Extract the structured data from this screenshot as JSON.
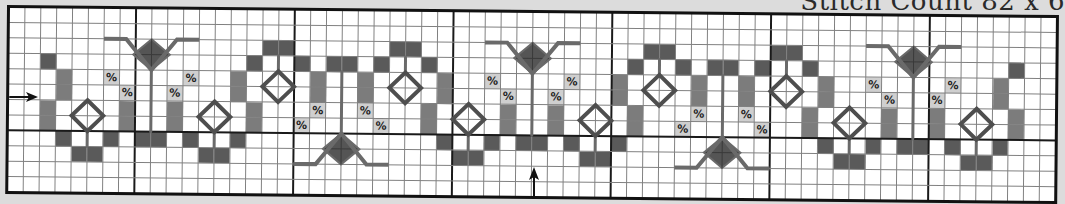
{
  "title": "Stitch Count 82 x 6",
  "chart": {
    "cols": 66,
    "rows": 12,
    "cell_w": 15.88,
    "cell_h": 15.42,
    "major_cols": [
      8,
      18,
      28,
      38,
      48,
      58
    ],
    "major_rows": [
      8
    ],
    "colors": {
      "background": "#ffffff",
      "grid": "#808080",
      "major": "#1a1a1a",
      "dark": "#5a5a5a",
      "medium": "#7c7c7c",
      "symbol_bg": "#cfcfcf",
      "backstitch": "#6a6a6a",
      "diamond_outline": "#4e4e4e",
      "flower_fill": "#555555"
    },
    "symbol_glyph": "%",
    "dark_cells": [
      [
        2,
        3
      ],
      [
        3,
        8
      ],
      [
        4,
        9
      ],
      [
        5,
        9
      ],
      [
        6,
        8
      ],
      [
        8,
        8
      ],
      [
        9,
        8
      ],
      [
        11,
        8
      ],
      [
        12,
        9
      ],
      [
        13,
        9
      ],
      [
        14,
        8
      ],
      [
        15,
        3
      ],
      [
        16,
        2
      ],
      [
        17,
        2
      ],
      [
        18,
        3
      ],
      [
        20,
        3
      ],
      [
        21,
        3
      ],
      [
        23,
        3
      ],
      [
        24,
        2
      ],
      [
        25,
        2
      ],
      [
        26,
        3
      ],
      [
        27,
        8
      ],
      [
        28,
        9
      ],
      [
        29,
        9
      ],
      [
        30,
        8
      ],
      [
        32,
        8
      ],
      [
        33,
        8
      ],
      [
        35,
        8
      ],
      [
        36,
        9
      ],
      [
        37,
        9
      ],
      [
        38,
        8
      ],
      [
        39,
        3
      ],
      [
        40,
        2
      ],
      [
        41,
        2
      ],
      [
        42,
        3
      ],
      [
        44,
        3
      ],
      [
        45,
        3
      ],
      [
        47,
        3
      ],
      [
        48,
        2
      ],
      [
        49,
        2
      ],
      [
        50,
        3
      ],
      [
        51,
        8
      ],
      [
        52,
        9
      ],
      [
        53,
        9
      ],
      [
        54,
        8
      ],
      [
        56,
        8
      ],
      [
        57,
        8
      ],
      [
        59,
        8
      ],
      [
        60,
        9
      ],
      [
        61,
        9
      ],
      [
        62,
        8
      ],
      [
        63,
        3
      ]
    ],
    "medium_cells": [
      [
        3,
        4
      ],
      [
        3,
        5
      ],
      [
        2,
        6
      ],
      [
        2,
        7
      ],
      [
        7,
        6
      ],
      [
        7,
        7
      ],
      [
        10,
        6
      ],
      [
        10,
        7
      ],
      [
        14,
        4
      ],
      [
        14,
        5
      ],
      [
        15,
        6
      ],
      [
        15,
        7
      ],
      [
        19,
        4
      ],
      [
        19,
        5
      ],
      [
        22,
        4
      ],
      [
        22,
        5
      ],
      [
        27,
        4
      ],
      [
        27,
        5
      ],
      [
        26,
        6
      ],
      [
        26,
        7
      ],
      [
        31,
        6
      ],
      [
        31,
        7
      ],
      [
        34,
        6
      ],
      [
        34,
        7
      ],
      [
        38,
        4
      ],
      [
        38,
        5
      ],
      [
        39,
        6
      ],
      [
        39,
        7
      ],
      [
        43,
        4
      ],
      [
        43,
        5
      ],
      [
        46,
        4
      ],
      [
        46,
        5
      ],
      [
        51,
        4
      ],
      [
        51,
        5
      ],
      [
        50,
        6
      ],
      [
        50,
        7
      ],
      [
        55,
        6
      ],
      [
        55,
        7
      ],
      [
        58,
        6
      ],
      [
        58,
        7
      ],
      [
        62,
        4
      ],
      [
        62,
        5
      ],
      [
        63,
        6
      ],
      [
        63,
        7
      ]
    ],
    "symbol_cells": [
      [
        6,
        4
      ],
      [
        7,
        5
      ],
      [
        10,
        5
      ],
      [
        11,
        4
      ],
      [
        19,
        6
      ],
      [
        18,
        7
      ],
      [
        22,
        6
      ],
      [
        23,
        7
      ],
      [
        30,
        4
      ],
      [
        31,
        5
      ],
      [
        34,
        5
      ],
      [
        35,
        4
      ],
      [
        43,
        6
      ],
      [
        42,
        7
      ],
      [
        46,
        6
      ],
      [
        47,
        7
      ],
      [
        54,
        4
      ],
      [
        55,
        5
      ],
      [
        58,
        5
      ],
      [
        59,
        4
      ]
    ],
    "outline_diamonds": [
      {
        "col": 5,
        "row": 7,
        "stem_dir": "down"
      },
      {
        "col": 13,
        "row": 7,
        "stem_dir": "down"
      },
      {
        "col": 17,
        "row": 5,
        "stem_dir": "up"
      },
      {
        "col": 25,
        "row": 5,
        "stem_dir": "up"
      },
      {
        "col": 29,
        "row": 7,
        "stem_dir": "down"
      },
      {
        "col": 37,
        "row": 7,
        "stem_dir": "down"
      },
      {
        "col": 41,
        "row": 5,
        "stem_dir": "up"
      },
      {
        "col": 49,
        "row": 5,
        "stem_dir": "up"
      },
      {
        "col": 53,
        "row": 7,
        "stem_dir": "down"
      },
      {
        "col": 61,
        "row": 7,
        "stem_dir": "down"
      }
    ],
    "flowers": [
      {
        "col": 9,
        "orientation": "up"
      },
      {
        "col": 21,
        "orientation": "down"
      },
      {
        "col": 33,
        "orientation": "up"
      },
      {
        "col": 45,
        "orientation": "down"
      },
      {
        "col": 57,
        "orientation": "up"
      }
    ],
    "arrows": [
      {
        "name": "row-center-arrow",
        "direction": "right",
        "x": 3,
        "y": 91,
        "length": 28
      },
      {
        "name": "column-center-arrow",
        "direction": "up",
        "x": 525,
        "y": 160,
        "length": 30
      }
    ]
  }
}
